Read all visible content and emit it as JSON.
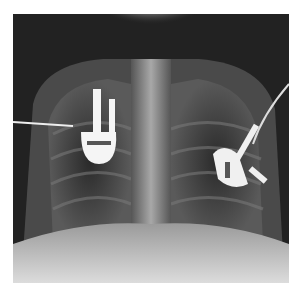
{
  "image": {
    "kind": "radiograph",
    "description": "Frontal chest X-ray with two ECG electrode clips and attached lead wires",
    "background": "#ffffff",
    "film_dark": "#1a1a1a",
    "bone_light": "#d8d8d8",
    "metal_white": "#f5f5f5"
  }
}
